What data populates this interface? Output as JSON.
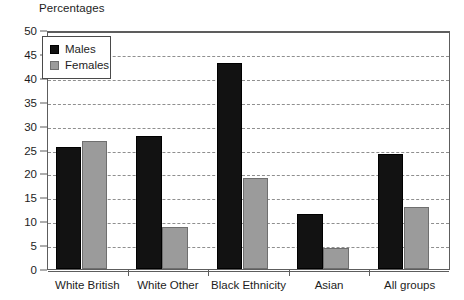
{
  "chart_data": {
    "type": "bar",
    "title": "Percentages",
    "xlabel": "",
    "ylabel": "",
    "ylim": [
      0,
      50
    ],
    "ytick_step": 5,
    "yticks": [
      50,
      45,
      40,
      35,
      30,
      25,
      20,
      15,
      10,
      5,
      0
    ],
    "grid": true,
    "grid_style": "dashed-horizontal",
    "legend_position": "top-left",
    "categories": [
      "White British",
      "White Other",
      "Black Ethnicity",
      "Asian",
      "All groups"
    ],
    "series": [
      {
        "name": "Males",
        "color": "#121212",
        "values": [
          25.5,
          27.8,
          43.0,
          11.5,
          24.0
        ]
      },
      {
        "name": "Females",
        "color": "#9b9b9b",
        "values": [
          26.7,
          8.8,
          19.0,
          4.5,
          13.0
        ]
      }
    ]
  },
  "legend": {
    "items": [
      {
        "label": "Males",
        "swatch": "males"
      },
      {
        "label": "Females",
        "swatch": "females"
      }
    ]
  },
  "colors": {
    "males": "#121212",
    "females": "#9b9b9b",
    "axis": "#5d5d5d",
    "gridline": "#8f8f8f",
    "background": "#ffffff",
    "text": "#1d1d1d"
  }
}
